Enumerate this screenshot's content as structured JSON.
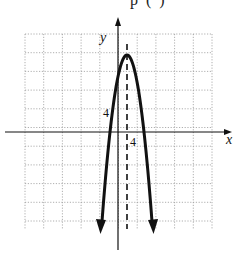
{
  "header_fragment": "p    (      )",
  "chart_data": {
    "type": "line",
    "title": "",
    "xlabel": "x",
    "ylabel": "y",
    "tick_labels": {
      "x": "4",
      "y": "4"
    },
    "grid": true,
    "grid_step": 4,
    "xlim": [
      -20,
      20
    ],
    "ylim": [
      -20,
      22
    ],
    "series": [
      {
        "name": "parabola",
        "style": "solid-thick-with-arrows",
        "equation": "y = -(x - 2)^2 + 16",
        "vertex": [
          2,
          16
        ],
        "x_intercepts": [
          -2,
          6
        ],
        "x": [
          -4,
          -3,
          -2,
          -1,
          0,
          1,
          2,
          3,
          4,
          5,
          6,
          7,
          8
        ],
        "values": [
          -20,
          -9,
          0,
          7,
          12,
          15,
          16,
          15,
          12,
          7,
          0,
          -9,
          -20
        ]
      },
      {
        "name": "axis of symmetry",
        "style": "dashed",
        "equation": "x = 2"
      }
    ]
  },
  "geometry": {
    "grid_left": 25,
    "grid_right": 212,
    "grid_top": 34,
    "grid_bottom": 229,
    "cell": 18.7,
    "origin_x": 118,
    "origin_y": 132,
    "vertex_px": [
      127,
      55
    ],
    "roots_px": [
      110,
      144
    ],
    "arrow_tips_px": [
      [
        100,
        230
      ],
      [
        154,
        230
      ]
    ]
  }
}
